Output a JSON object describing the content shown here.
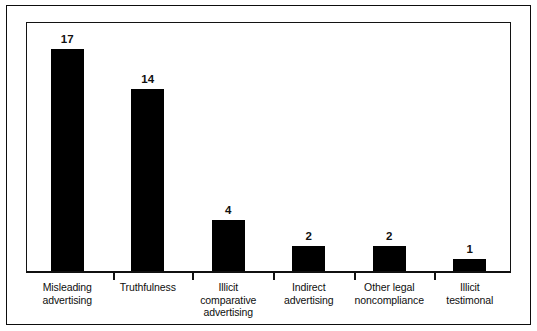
{
  "chart_data": {
    "type": "bar",
    "title": "",
    "subtitle": "",
    "xlabel": "",
    "ylabel": "",
    "ylim": [
      0,
      18
    ],
    "grid": false,
    "legend": "none",
    "orientation": "vertical",
    "bar_color": "#000000",
    "categories": [
      "Misleading advertising",
      "Truthfulness",
      "Illicit comparative advertising",
      "Indirect advertising",
      "Other legal noncompliance",
      "Illicit testimonal"
    ],
    "category_lines": [
      [
        "Misleading",
        "advertising"
      ],
      [
        "Truthfulness",
        ""
      ],
      [
        "Illicit comparative",
        "advertising"
      ],
      [
        "Indirect",
        "advertising"
      ],
      [
        "Other legal",
        "noncompliance"
      ],
      [
        "Illicit",
        "testimonal"
      ]
    ],
    "values": [
      17,
      14,
      4,
      2,
      2,
      1
    ],
    "value_labels": [
      "17",
      "14",
      "4",
      "2",
      "2",
      "1"
    ],
    "axis": {
      "baseline_visible": true,
      "tick_count": 5,
      "tick_positions_pct": [
        17.8,
        34.2,
        51.0,
        67.6,
        84.3
      ]
    }
  },
  "frame": {
    "outer_border_color": "#0d0d0d",
    "inner_border_color": "#131313",
    "background": "#ffffff"
  }
}
